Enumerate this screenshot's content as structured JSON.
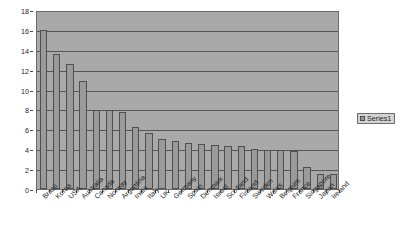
{
  "chart_data": {
    "type": "bar",
    "title": "",
    "xlabel": "",
    "ylabel": "Total Entrepreneurial Activity",
    "ylim": [
      0,
      18
    ],
    "ytick_step": 2,
    "yticks": [
      0,
      2,
      4,
      6,
      8,
      10,
      12,
      14,
      16,
      18
    ],
    "grid": "horizontal",
    "legend_position": "right",
    "legend_entries": [
      "Series1"
    ],
    "categories": [
      "Brazil",
      "Korea",
      "USA",
      "Australia",
      "Canada",
      "Norway",
      "Argentina",
      "India",
      "Italy",
      "UK",
      "Germany",
      "Spain",
      "Denmark",
      "Israel",
      "Scotland",
      "Finland",
      "Sweden",
      "Wales",
      "Belgium",
      "France",
      "Singapore",
      "Japan",
      "Ireland"
    ],
    "series": [
      {
        "name": "Series1",
        "values": [
          16.0,
          13.6,
          12.6,
          10.9,
          7.9,
          7.9,
          7.7,
          6.2,
          5.6,
          5.0,
          4.8,
          4.6,
          4.5,
          4.4,
          4.3,
          4.3,
          4.0,
          3.9,
          3.9,
          3.8,
          2.2,
          1.5,
          1.5
        ],
        "color": "#9a9a9a"
      }
    ]
  },
  "legend": {
    "series_label": "Series1"
  },
  "colors": {
    "plot_background": "#a9a9a9",
    "bar_fill": "#9a9a9a",
    "bar_border": "#4f4f4f",
    "gridline": "#555555",
    "axis_text": "#1d1d1d"
  }
}
